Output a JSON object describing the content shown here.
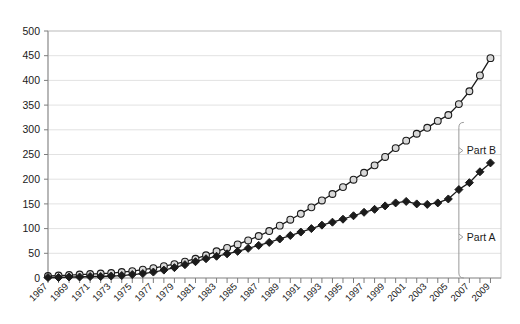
{
  "chart_data": {
    "type": "line",
    "title": "",
    "subtitle": "",
    "xlabel": "",
    "ylabel": "",
    "xlim": [
      1967,
      2010
    ],
    "ylim": [
      0,
      500
    ],
    "ytick_step": 50,
    "yticks": [
      0,
      50,
      100,
      150,
      200,
      250,
      300,
      350,
      400,
      450,
      500
    ],
    "ytick_labels": [
      "0",
      "50",
      "100",
      "150",
      "200",
      "250",
      "300",
      "350",
      "400",
      "450",
      "500"
    ],
    "x": [
      1967,
      1968,
      1969,
      1970,
      1971,
      1972,
      1973,
      1974,
      1975,
      1976,
      1977,
      1978,
      1979,
      1980,
      1981,
      1982,
      1983,
      1984,
      1985,
      1986,
      1987,
      1988,
      1989,
      1990,
      1991,
      1992,
      1993,
      1994,
      1995,
      1996,
      1997,
      1998,
      1999,
      2000,
      2001,
      2002,
      2003,
      2004,
      2005,
      2006,
      2007,
      2008,
      2009
    ],
    "xtick_labels": [
      "1967",
      "1969",
      "1971",
      "1973",
      "1975",
      "1977",
      "1979",
      "1981",
      "1983",
      "1985",
      "1987",
      "1989",
      "1991",
      "1993",
      "1995",
      "1997",
      "1999",
      "2001",
      "2003",
      "2005",
      "2007",
      "2009"
    ],
    "xtick_label_years": [
      1967,
      1969,
      1971,
      1973,
      1975,
      1977,
      1979,
      1981,
      1983,
      1985,
      1987,
      1989,
      1991,
      1993,
      1995,
      1997,
      1999,
      2001,
      2003,
      2005,
      2007,
      2009
    ],
    "xtick_rotation": -45,
    "grid": true,
    "grid_axis": "y",
    "legend": "none",
    "series": [
      {
        "name": "Total",
        "marker": "circle-open",
        "marker_fill": "#d9d9d9",
        "line_color": "#1b1b1b",
        "values": [
          4,
          5,
          6,
          7,
          8,
          9,
          10,
          12,
          14,
          17,
          20,
          24,
          28,
          33,
          39,
          46,
          54,
          61,
          68,
          76,
          85,
          95,
          106,
          118,
          130,
          143,
          157,
          170,
          184,
          199,
          213,
          228,
          245,
          263,
          278,
          292,
          304,
          318,
          330,
          352,
          378,
          410,
          445
        ]
      },
      {
        "name": "Part A",
        "marker": "diamond-filled",
        "marker_fill": "#1b1b1b",
        "line_color": "#1b1b1b",
        "values": [
          1,
          1,
          2,
          2,
          3,
          3,
          4,
          5,
          7,
          9,
          12,
          16,
          21,
          27,
          33,
          39,
          44,
          49,
          54,
          60,
          66,
          72,
          79,
          86,
          93,
          100,
          107,
          113,
          119,
          126,
          133,
          139,
          146,
          152,
          155,
          150,
          149,
          152,
          160,
          179,
          193,
          215,
          233
        ]
      }
    ],
    "annotations": [
      {
        "label": "Part B",
        "at_year": 2006,
        "value": 258,
        "pointer": true
      },
      {
        "label": "Part A",
        "at_year": 2006,
        "value": 83,
        "pointer": true
      }
    ],
    "bracket": {
      "at_year": 2006,
      "top_value": 315,
      "bottom_value": 0,
      "color": "#9a9a9a"
    }
  },
  "colors": {
    "background": "#ffffff",
    "gridline": "#e2e2e2",
    "axis": "#9a9a9a",
    "series_dark": "#1b1b1b",
    "marker_light": "#d9d9d9",
    "text": "#1a1a1a"
  }
}
